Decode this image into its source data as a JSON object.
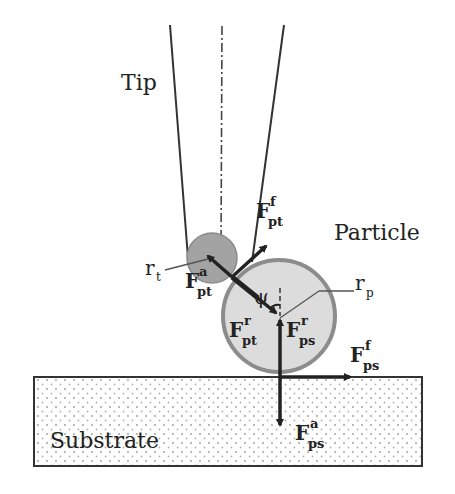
{
  "diagram": {
    "labels": {
      "tip": "Tip",
      "particle": "Particle",
      "substrate": "Substrate",
      "angle": "ψ"
    },
    "radii": {
      "tip": {
        "base": "r",
        "sub": "t"
      },
      "particle": {
        "base": "r",
        "sub": "p"
      }
    },
    "forces": {
      "F_pt_f": {
        "base": "F",
        "sup": "f",
        "sub": "pt"
      },
      "F_pt_a": {
        "base": "F",
        "sup": "a",
        "sub": "pt"
      },
      "F_pt_r": {
        "base": "F",
        "sup": "r",
        "sub": "pt"
      },
      "F_ps_r": {
        "base": "F",
        "sup": "r",
        "sub": "ps"
      },
      "F_ps_f": {
        "base": "F",
        "sup": "f",
        "sub": "ps"
      },
      "F_ps_a": {
        "base": "F",
        "sup": "a",
        "sub": "ps"
      }
    },
    "colors": {
      "tip_sphere": "#a3a3a3",
      "particle_fill": "#dcdcdc",
      "particle_stroke": "#8c8c8c",
      "line": "#222222",
      "dots": "#9a9a9a"
    }
  }
}
